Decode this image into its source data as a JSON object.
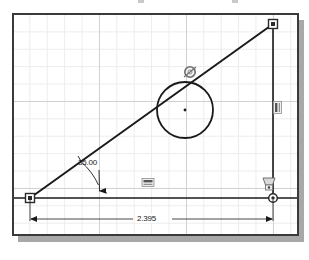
{
  "app": {
    "title": "CAD Sketch Viewport",
    "type": "2d-parametric-sketch"
  },
  "viewport": {
    "background_color": "#ffffff",
    "frame_color": "#3a3a3a",
    "shadow_color": "#a8a8a8",
    "grid": {
      "visible": true,
      "minor_color": "#ececec",
      "major_color": "#d2d2d2",
      "minor_spacing_px": 17.4,
      "major_spacing_px": 87
    }
  },
  "geometry": {
    "entity_color": "#1a1a1a",
    "entities": [
      {
        "name": "hypotenuse-line",
        "type": "line",
        "from": [
          30,
          198
        ],
        "to": [
          273,
          24
        ]
      },
      {
        "name": "base-line",
        "type": "line",
        "from": [
          12,
          198
        ],
        "to": [
          297,
          198
        ]
      },
      {
        "name": "vertical-line",
        "type": "line",
        "from": [
          273,
          24
        ],
        "to": [
          273,
          198
        ]
      },
      {
        "name": "circle",
        "type": "circle",
        "center": [
          185,
          110
        ],
        "radius": 28
      }
    ],
    "points": [
      {
        "name": "point-bottom-left",
        "type": "square",
        "at": [
          30,
          198
        ]
      },
      {
        "name": "point-top-right",
        "type": "square",
        "at": [
          273,
          24
        ]
      },
      {
        "name": "point-bottom-right",
        "type": "circle",
        "at": [
          273,
          198
        ]
      },
      {
        "name": "point-circle-center",
        "type": "dot",
        "at": [
          185,
          110
        ]
      }
    ]
  },
  "dimensions": [
    {
      "name": "angle-dimension",
      "type": "angular",
      "value": "35.00",
      "units": "degrees",
      "vertex": [
        30,
        198
      ],
      "label_position": [
        78,
        158
      ]
    },
    {
      "name": "length-dimension",
      "type": "linear",
      "value": "2.395",
      "units": "inches",
      "from": [
        30,
        198
      ],
      "to": [
        273,
        198
      ],
      "label_position": [
        135,
        214
      ]
    }
  ],
  "constraints": [
    {
      "name": "tangent-constraint",
      "glyph": "tangent-icon",
      "at": [
        190,
        72
      ],
      "description": "Line tangent to circle"
    },
    {
      "name": "horizontal-constraint",
      "glyph": "horizontal-icon",
      "at": [
        148,
        183
      ],
      "description": "Base line horizontal"
    },
    {
      "name": "vertical-constraint",
      "glyph": "vertical-icon",
      "at": [
        277,
        107
      ],
      "description": "Right line vertical"
    },
    {
      "name": "coincident-constraint",
      "glyph": "coincident-icon",
      "at": [
        268,
        183
      ],
      "description": "Endpoint coincident"
    }
  ],
  "labels": {
    "angle_value": "35.00",
    "length_value": "2.395"
  }
}
